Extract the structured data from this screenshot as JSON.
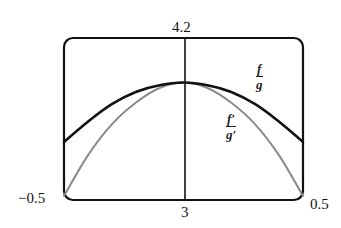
{
  "chart_data": {
    "type": "line",
    "title": "",
    "xlabel": "",
    "ylabel": "",
    "xlim": [
      -0.5,
      0.5
    ],
    "ylim": [
      3,
      4.2
    ],
    "grid": false,
    "window_labels": {
      "xmin": "−0.5",
      "xmax": "0.5",
      "ymin": "3",
      "ymax": "4.2"
    },
    "series": [
      {
        "name": "f/g",
        "label_num": "f",
        "label_den": "g",
        "color": "#111111",
        "width": 2.6,
        "x": [
          -0.5,
          -0.4,
          -0.3,
          -0.2,
          -0.1,
          0,
          0.1,
          0.2,
          0.3,
          0.4,
          0.5
        ],
        "y": [
          3.43,
          3.58,
          3.71,
          3.8,
          3.85,
          3.87,
          3.85,
          3.8,
          3.71,
          3.58,
          3.43
        ]
      },
      {
        "name": "f'/g'",
        "label_num": "f′",
        "label_den": "g′",
        "color": "#8a8a8a",
        "width": 2,
        "x": [
          -0.5,
          -0.4,
          -0.3,
          -0.2,
          -0.1,
          0,
          0.1,
          0.2,
          0.3,
          0.4,
          0.5
        ],
        "y": [
          3.03,
          3.33,
          3.56,
          3.72,
          3.83,
          3.87,
          3.83,
          3.72,
          3.56,
          3.33,
          3.03
        ]
      }
    ]
  }
}
